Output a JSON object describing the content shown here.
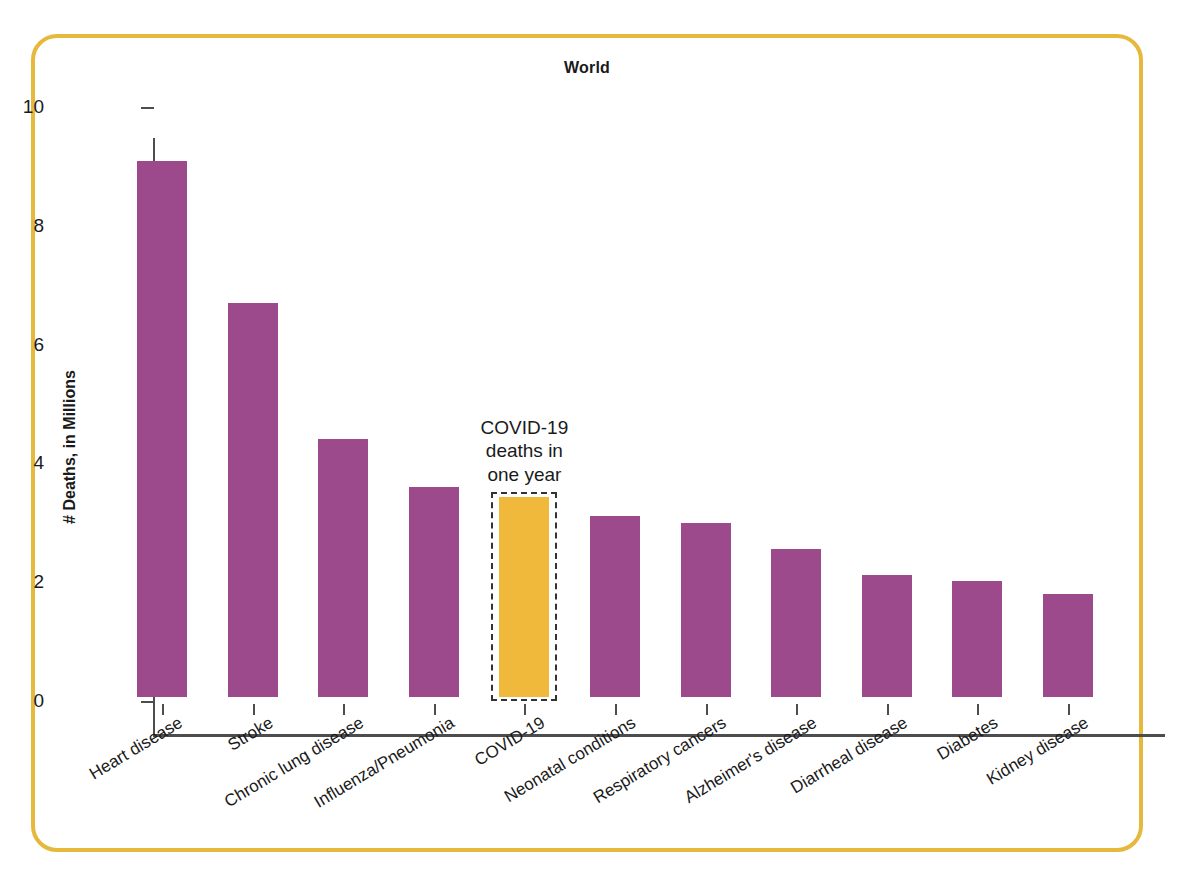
{
  "frame": {
    "border_color": "#e6b93c"
  },
  "chart_data": {
    "type": "bar",
    "title": "World",
    "xlabel": "",
    "ylabel": "# Deaths, in Millions",
    "ylim": [
      0,
      10
    ],
    "yticks": [
      "0",
      "2",
      "4",
      "6",
      "8",
      "10"
    ],
    "grid": false,
    "legend": null,
    "bar_color": "#9c4a8c",
    "highlight_color": "#f0b93c",
    "categories": [
      "Heart disease",
      "Stroke",
      "Chronic lung disease",
      "Influenza/Pneumonia",
      "COVID-19",
      "Neonatal conditions",
      "Respiratory cancers",
      "Alzheimer's disease",
      "Diarrheal disease",
      "Diabetes",
      "Kidney disease"
    ],
    "values": [
      9.02,
      6.64,
      4.34,
      3.53,
      3.37,
      3.05,
      2.93,
      2.49,
      2.06,
      1.95,
      1.73
    ],
    "highlighted_index": 4,
    "annotation": {
      "lines": [
        "COVID-19",
        "deaths in",
        "one year"
      ],
      "target_category": "COVID-19",
      "style": "dashed-box"
    }
  }
}
